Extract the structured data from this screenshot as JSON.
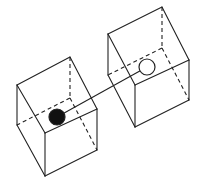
{
  "diagram": {
    "description": "Two wireframe cubes connected by a straight rod; a solid black sphere sits in the left cube and a hollow white sphere sits in the right cube",
    "colors": {
      "line": "#222222",
      "background": "#ffffff",
      "solid_ball": "#111111",
      "hollow_ball": "#ffffff"
    },
    "cubes": [
      {
        "id": "left-cube",
        "visible_edges": [
          [
            17,
            85,
            70,
            57
          ],
          [
            70,
            57,
            97,
            109
          ],
          [
            97,
            109,
            45,
            133
          ],
          [
            45,
            133,
            17,
            85
          ],
          [
            17,
            85,
            17,
            125
          ],
          [
            17,
            125,
            45,
            176
          ],
          [
            45,
            133,
            45,
            176
          ],
          [
            45,
            176,
            97,
            150
          ],
          [
            97,
            150,
            97,
            109
          ]
        ],
        "hidden_edges": [
          [
            70,
            57,
            70,
            98
          ],
          [
            70,
            98,
            17,
            125
          ],
          [
            70,
            98,
            97,
            150
          ]
        ]
      },
      {
        "id": "right-cube",
        "visible_edges": [
          [
            108,
            34,
            162,
            7
          ],
          [
            162,
            7,
            189,
            60
          ],
          [
            189,
            60,
            135,
            85
          ],
          [
            135,
            85,
            108,
            34
          ],
          [
            108,
            34,
            108,
            75
          ],
          [
            108,
            75,
            135,
            127
          ],
          [
            135,
            85,
            135,
            127
          ],
          [
            135,
            127,
            189,
            100
          ],
          [
            189,
            100,
            189,
            60
          ]
        ],
        "hidden_edges": [
          [
            162,
            7,
            162,
            48
          ],
          [
            162,
            48,
            108,
            75
          ],
          [
            162,
            48,
            189,
            100
          ]
        ]
      }
    ],
    "rod": {
      "x1": 57,
      "y1": 117,
      "x2": 147,
      "y2": 67
    },
    "balls": [
      {
        "id": "black-ball",
        "cx": 57,
        "cy": 117,
        "r": 8,
        "fill": "#111111"
      },
      {
        "id": "white-ball",
        "cx": 147,
        "cy": 67,
        "r": 8,
        "fill": "#ffffff"
      }
    ]
  }
}
